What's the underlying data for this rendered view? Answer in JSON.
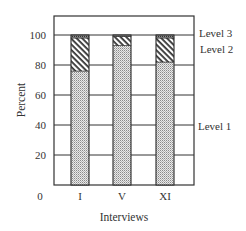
{
  "chart_data": {
    "type": "bar",
    "stacked": true,
    "title": "",
    "xlabel": "Interviews",
    "ylabel": "Percent",
    "categories": [
      "I",
      "V",
      "XI"
    ],
    "series": [
      {
        "name": "Level 1",
        "values": [
          76,
          93,
          82
        ],
        "pattern": "dotted"
      },
      {
        "name": "Level 2",
        "values": [
          22,
          6,
          16
        ],
        "pattern": "diagonal-hatch"
      },
      {
        "name": "Level 3",
        "values": [
          2,
          1,
          2
        ],
        "pattern": "dark-dotted"
      }
    ],
    "yticks": [
      0,
      20,
      40,
      60,
      80,
      100
    ],
    "ylim": [
      0,
      110
    ],
    "grid": true,
    "legend": {
      "position": "right",
      "entries": [
        "Level 3",
        "Level 2",
        "Level 1"
      ]
    }
  },
  "labels": {
    "xlabel": "Interviews",
    "ylabel": "Percent",
    "zero": "0",
    "yticks": [
      "20",
      "40",
      "60",
      "80",
      "100"
    ],
    "categories": [
      "I",
      "V",
      "XI"
    ],
    "level3": "Level 3",
    "level2": "Level 2",
    "level1": "Level 1"
  }
}
